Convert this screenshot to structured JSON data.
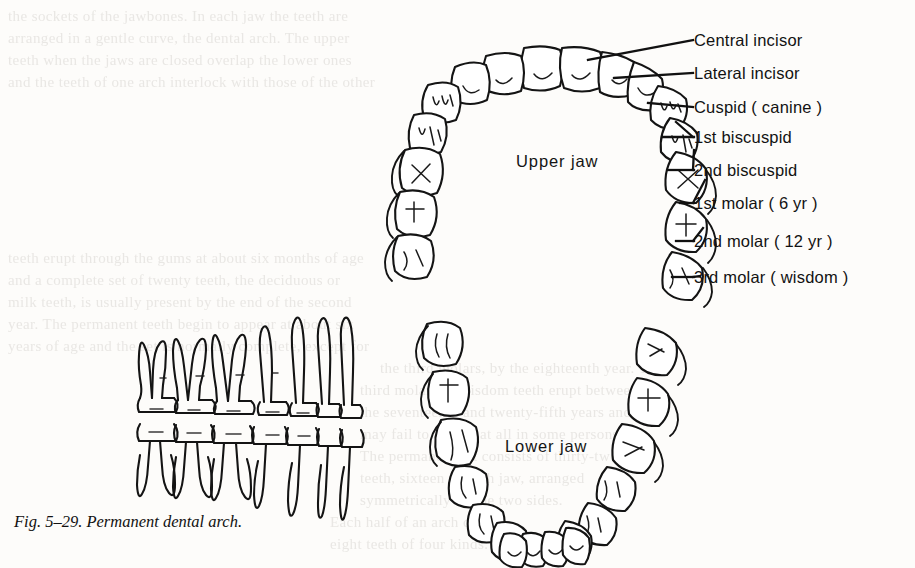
{
  "figure": {
    "caption": "Fig. 5–29. Permanent dental arch.",
    "caption_number": "5–29",
    "caption_title": "Permanent dental arch."
  },
  "arches": {
    "upper": {
      "label": "Upper jaw",
      "tooth_count": 16
    },
    "lower": {
      "label": "Lower jaw",
      "tooth_count": 16
    }
  },
  "callouts": [
    {
      "label": "Central incisor",
      "y": 40
    },
    {
      "label": "Lateral incisor",
      "y": 73
    },
    {
      "label": "Cuspid ( canine )",
      "y": 107
    },
    {
      "label": "1st biscuspid",
      "y": 137
    },
    {
      "label": "2nd biscuspid",
      "y": 170
    },
    {
      "label": "1st molar ( 6 yr )",
      "y": 203
    },
    {
      "label": "2nd molar ( 12 yr )",
      "y": 241
    },
    {
      "label": "3rd molar ( wisdom )",
      "y": 277
    }
  ],
  "side_view": {
    "name": "lateral-tooth-row",
    "description": "Lateral view of upper and lower tooth rows with roots"
  },
  "colors": {
    "ink": "#141414",
    "paper": "#fdfcfa",
    "showthrough": "#e9e7e4"
  },
  "showthrough_lines": [
    {
      "x": 8,
      "y": 8,
      "text": "the sockets of the jawbones. In each jaw the teeth are"
    },
    {
      "x": 8,
      "y": 30,
      "text": "arranged in a gentle curve, the dental arch. The upper"
    },
    {
      "x": 8,
      "y": 52,
      "text": "teeth when the jaws are closed overlap the lower ones"
    },
    {
      "x": 8,
      "y": 74,
      "text": "and the teeth of one arch interlock with those of the other"
    },
    {
      "x": 8,
      "y": 250,
      "text": "teeth erupt through the gums at about six months of age"
    },
    {
      "x": 8,
      "y": 272,
      "text": "and a complete set of twenty teeth, the deciduous or"
    },
    {
      "x": 8,
      "y": 294,
      "text": "milk teeth, is usually present by the end of the second"
    },
    {
      "x": 8,
      "y": 316,
      "text": "year. The permanent teeth begin to appear at about six"
    },
    {
      "x": 8,
      "y": 338,
      "text": "years of age and the set is normally complete, except for"
    },
    {
      "x": 380,
      "y": 360,
      "text": "the third molars, by the eighteenth year. The"
    },
    {
      "x": 360,
      "y": 382,
      "text": "third molars or wisdom teeth erupt between"
    },
    {
      "x": 360,
      "y": 404,
      "text": "the seventeenth and twenty-fifth years and"
    },
    {
      "x": 360,
      "y": 426,
      "text": "may fail to appear at all in some persons."
    },
    {
      "x": 360,
      "y": 448,
      "text": "The permanent set consists of thirty-two"
    },
    {
      "x": 360,
      "y": 470,
      "text": "teeth, sixteen in each jaw, arranged"
    },
    {
      "x": 360,
      "y": 492,
      "text": "symmetrically on the two sides."
    },
    {
      "x": 330,
      "y": 514,
      "text": "Each half of an arch carries"
    },
    {
      "x": 330,
      "y": 536,
      "text": "eight teeth of four kinds."
    }
  ]
}
